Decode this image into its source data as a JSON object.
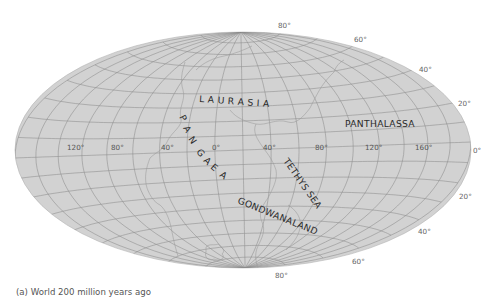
{
  "figure": {
    "caption": "(a) World 200 million years ago",
    "projection": "elliptical (Hammer/Aitoff-like)",
    "colors": {
      "ocean": "#d2d2d2",
      "grid": "#8c8c8c",
      "coast": "#9a9a9a",
      "text": "#2a2a2a"
    }
  },
  "labels": {
    "landmasses": {
      "laurasia": "L A U R A S I A",
      "pangaea": [
        "P",
        "A",
        "N",
        "G",
        "A",
        "E",
        "A"
      ],
      "gondwanaland": "GONDWANALAND"
    },
    "water": {
      "panthalassa": "PANTHALASSA",
      "tethys_sea": "TETHYS SEA"
    }
  },
  "longitude_labels": [
    "120°",
    "80°",
    "40°",
    "0°",
    "40°",
    "80°",
    "120°",
    "160°"
  ],
  "latitude_labels": {
    "north": [
      "80°",
      "60°",
      "40°",
      "20°"
    ],
    "equator": "0°",
    "south": [
      "20°",
      "40°",
      "60°",
      "80°"
    ]
  }
}
